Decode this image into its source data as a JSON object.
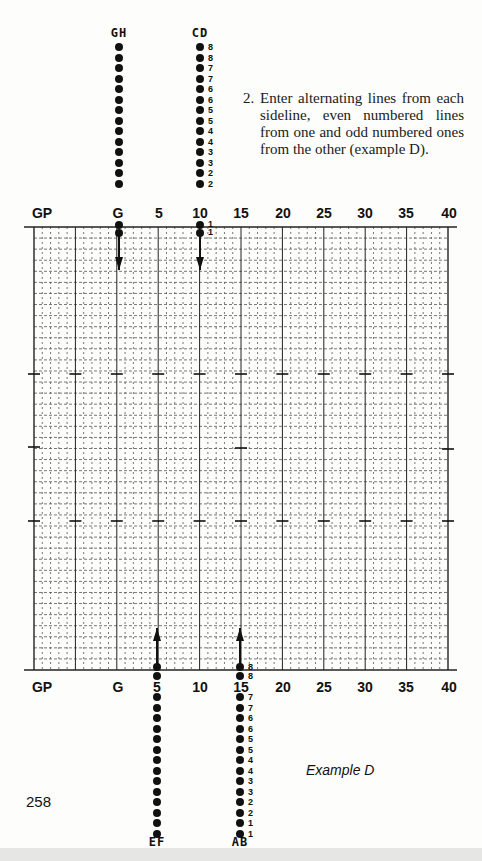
{
  "page": {
    "page_number": "258",
    "caption": "Example D",
    "instruction": {
      "number": "2.",
      "text": "Enter alternating lines from each sideline, even numbered lines from one and odd numbered ones from the other (example D)."
    }
  },
  "grid": {
    "x_left": 34,
    "x_right": 448,
    "y_top": 227,
    "y_bottom": 670,
    "columns": 50,
    "rows": 40,
    "top_axis_labels": [
      {
        "label": "GP",
        "x": 42
      },
      {
        "label": "G",
        "x": 118
      },
      {
        "label": "5",
        "x": 159
      },
      {
        "label": "10",
        "x": 200
      },
      {
        "label": "15",
        "x": 241
      },
      {
        "label": "20",
        "x": 283
      },
      {
        "label": "25",
        "x": 324
      },
      {
        "label": "30",
        "x": 365
      },
      {
        "label": "35",
        "x": 406
      },
      {
        "label": "40",
        "x": 449
      }
    ],
    "bottom_axis_labels": [
      {
        "label": "GP",
        "x": 42
      },
      {
        "label": "G",
        "x": 118
      },
      {
        "label": "5",
        "x": 157
      },
      {
        "label": "10",
        "x": 200
      },
      {
        "label": "15",
        "x": 241
      },
      {
        "label": "20",
        "x": 283
      },
      {
        "label": "25",
        "x": 324
      },
      {
        "label": "30",
        "x": 365
      },
      {
        "label": "35",
        "x": 406
      },
      {
        "label": "40",
        "x": 449
      }
    ]
  },
  "sidelines": {
    "top": [
      {
        "name": "GH",
        "x": 119,
        "numbers": []
      },
      {
        "name": "CD",
        "x": 200,
        "numbers": [
          "8",
          "8",
          "7",
          "7",
          "6",
          "6",
          "5",
          "5",
          "4",
          "4",
          "3",
          "3",
          "2",
          "2"
        ],
        "entry_numbers": [
          "1",
          "1"
        ]
      }
    ],
    "bottom": [
      {
        "name": "EF",
        "x": 157,
        "numbers": []
      },
      {
        "name": "AB",
        "x": 240,
        "numbers": [
          "7",
          "7",
          "6",
          "6",
          "5",
          "5",
          "4",
          "4",
          "3",
          "3",
          "2",
          "2",
          "1",
          "1"
        ],
        "entry_numbers": [
          "8",
          "8"
        ]
      }
    ]
  },
  "chart_data": {
    "type": "diagram",
    "title": "Example D",
    "x_ticks": [
      "GP",
      "G",
      "5",
      "10",
      "15",
      "20",
      "25",
      "30",
      "35",
      "40"
    ],
    "lines": [
      {
        "group": "GH",
        "side": "top",
        "position": "G",
        "direction": "down",
        "dots": 16
      },
      {
        "group": "CD",
        "side": "top",
        "position": "10",
        "direction": "down",
        "labels": [
          "8",
          "8",
          "7",
          "7",
          "6",
          "6",
          "5",
          "5",
          "4",
          "4",
          "3",
          "3",
          "2",
          "2",
          "1",
          "1"
        ]
      },
      {
        "group": "EF",
        "side": "bottom",
        "position": "5",
        "direction": "up",
        "dots": 16
      },
      {
        "group": "AB",
        "side": "bottom",
        "position": "15",
        "direction": "up",
        "labels": [
          "8",
          "8",
          "7",
          "7",
          "6",
          "6",
          "5",
          "5",
          "4",
          "4",
          "3",
          "3",
          "2",
          "2",
          "1",
          "1"
        ]
      }
    ]
  }
}
